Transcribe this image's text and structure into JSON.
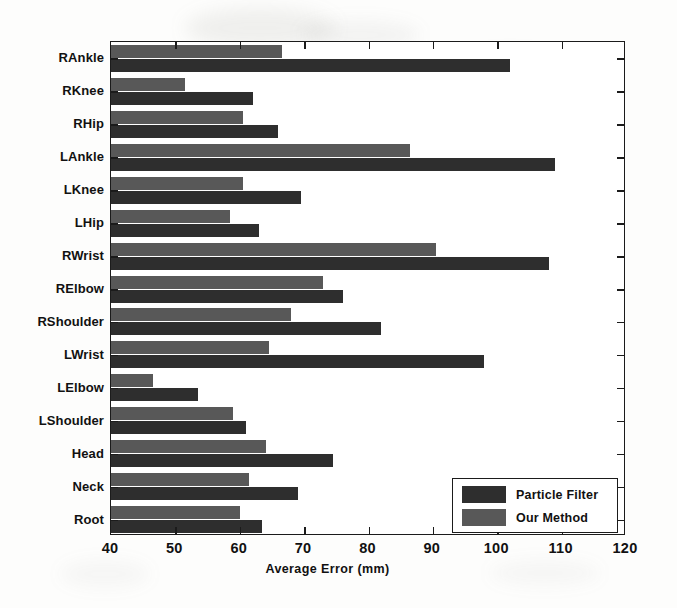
{
  "chart_data": {
    "type": "bar",
    "orientation": "horizontal",
    "title": "",
    "xlabel": "Average Error (mm)",
    "ylabel": "",
    "xlim": [
      40,
      120
    ],
    "xticks": [
      40,
      50,
      60,
      70,
      80,
      90,
      100,
      110,
      120
    ],
    "grid": false,
    "legend_position": "bottom-right",
    "categories": [
      "RAnkle",
      "RKnee",
      "RHip",
      "LAnkle",
      "LKnee",
      "LHip",
      "RWrist",
      "RElbow",
      "RShoulder",
      "LWrist",
      "LElbow",
      "LShoulder",
      "Head",
      "Neck",
      "Root"
    ],
    "series": [
      {
        "name": "Particle Filter",
        "color": "#2e2e2e",
        "values": [
          102,
          62,
          66,
          109,
          69.5,
          63,
          108,
          76,
          82,
          98,
          53.5,
          61,
          74.5,
          69,
          63.5
        ]
      },
      {
        "name": "Our Method",
        "color": "#585858",
        "values": [
          66.5,
          51.5,
          60.5,
          86.5,
          60.5,
          58.5,
          90.5,
          73,
          68,
          64.5,
          46.5,
          59,
          64,
          61.5,
          60
        ]
      }
    ]
  },
  "legend": {
    "entries": [
      {
        "label": "Particle Filter",
        "swatch": "dark"
      },
      {
        "label": "Our Method",
        "swatch": "light"
      }
    ]
  }
}
